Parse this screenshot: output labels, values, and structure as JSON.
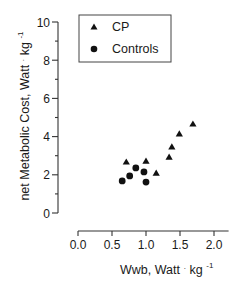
{
  "chart_data": {
    "type": "scatter",
    "title": "",
    "xlabel": "Wwb, Watt · kg⁻¹",
    "xlabel_parts": {
      "main": "Wwb,  Watt",
      "dot": "·",
      "unit": "kg",
      "exp": "-1"
    },
    "ylabel": "net Metabolic Cost, Watt · kg⁻¹",
    "ylabel_parts": {
      "main": "net Metabolic Cost, Watt",
      "dot": "·",
      "unit": "kg",
      "exp": "-1"
    },
    "xlim": [
      0.0,
      2.2
    ],
    "ylim": [
      0,
      10
    ],
    "x_ticks": [
      0.0,
      0.5,
      1.0,
      1.5,
      2.0
    ],
    "x_tick_labels": [
      "0.0",
      "0.5",
      "1.0",
      "1.5",
      "2.0"
    ],
    "y_ticks": [
      0,
      2,
      4,
      6,
      8,
      10
    ],
    "y_tick_labels": [
      "0",
      "2",
      "4",
      "6",
      "8",
      "10"
    ],
    "y_minor_ticks": [
      1,
      3,
      5,
      7,
      9
    ],
    "grid": false,
    "legend_position": "upper-left",
    "series": [
      {
        "name": "CP",
        "marker": "triangle",
        "color": "#111111",
        "points": [
          {
            "x": 0.71,
            "y": 2.67
          },
          {
            "x": 1.0,
            "y": 2.72
          },
          {
            "x": 1.15,
            "y": 2.09
          },
          {
            "x": 1.34,
            "y": 2.93
          },
          {
            "x": 1.38,
            "y": 3.46
          },
          {
            "x": 1.49,
            "y": 4.14
          },
          {
            "x": 1.69,
            "y": 4.66
          }
        ]
      },
      {
        "name": "Controls",
        "marker": "circle",
        "color": "#111111",
        "points": [
          {
            "x": 0.65,
            "y": 1.68
          },
          {
            "x": 0.76,
            "y": 1.94
          },
          {
            "x": 0.85,
            "y": 2.36
          },
          {
            "x": 0.97,
            "y": 2.15
          },
          {
            "x": 1.0,
            "y": 1.62
          }
        ]
      }
    ]
  },
  "legend": {
    "items": [
      {
        "label": "CP",
        "marker": "triangle"
      },
      {
        "label": "Controls",
        "marker": "circle"
      }
    ]
  }
}
